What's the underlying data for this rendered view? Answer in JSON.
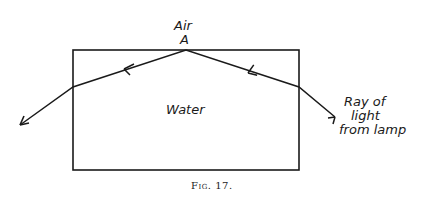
{
  "figure": {
    "caption": "Fig. 17.",
    "labels": {
      "air": "Air",
      "point_a": "A",
      "water": "Water",
      "ray_line1": "Ray of",
      "ray_line2": "light",
      "ray_line3": "from lamp"
    },
    "tank": {
      "x": 73,
      "y": 50,
      "width": 226,
      "height": 120
    },
    "ray_path": [
      [
        335,
        117
      ],
      [
        299,
        87
      ],
      [
        186,
        50
      ],
      [
        73,
        87
      ],
      [
        20,
        125
      ]
    ],
    "colors": {
      "ink": "#1a1a1a",
      "background": "#ffffff"
    }
  }
}
